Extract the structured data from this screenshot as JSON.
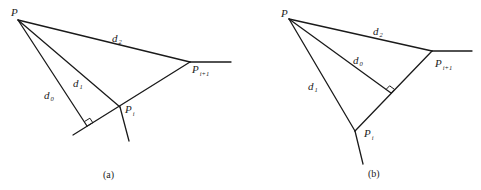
{
  "figure": {
    "panels": [
      {
        "id": "a",
        "caption": "(a)",
        "labels": {
          "P": "P",
          "Pi_base": "P",
          "Pi_sub": "i",
          "Pi1_base": "P",
          "Pi1_sub": "i+1",
          "d0_base": "d",
          "d0_sub": "0",
          "d1_base": "d",
          "d1_sub": "1",
          "d2_base": "d",
          "d2_sub": "2"
        },
        "description": "Perpendicular d0 from P falls on the extension of segment Pi–Pi+1 beyond Pi"
      },
      {
        "id": "b",
        "caption": "(b)",
        "labels": {
          "P": "P",
          "Pi_base": "P",
          "Pi_sub": "i",
          "Pi1_base": "P",
          "Pi1_sub": "i+1",
          "d0_base": "d",
          "d0_sub": "0",
          "d1_base": "d",
          "d1_sub": "1",
          "d2_base": "d",
          "d2_sub": "2"
        },
        "description": "Perpendicular d0 from P falls within segment Pi–Pi+1"
      }
    ],
    "colors": {
      "line": "#1a1a1a",
      "background": "#ffffff"
    }
  }
}
